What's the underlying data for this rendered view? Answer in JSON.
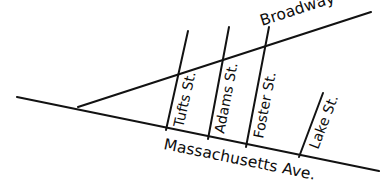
{
  "figure": {
    "name": "street-map-diagram",
    "background_color": "#ffffff",
    "line_color": "#121212",
    "text_color": "#0d0d0d",
    "width": 385,
    "height": 184
  },
  "roads": {
    "major": [
      {
        "id": "broadway",
        "label": "Broadway",
        "type": "avenue",
        "x1": 78,
        "y1": 107,
        "x2": 371,
        "y2": 12,
        "label_x": 262,
        "label_y": 26,
        "label_rotation": -18
      },
      {
        "id": "massachusetts-ave",
        "label": "Massachusetts Ave.",
        "type": "avenue",
        "x1": 17,
        "y1": 97,
        "x2": 379,
        "y2": 171,
        "label_x": 163,
        "label_y": 149,
        "label_rotation": 11.5
      }
    ],
    "cross": [
      {
        "id": "tufts-st",
        "label": "Tufts St.",
        "x1": 188,
        "y1": 31,
        "x2": 166,
        "y2": 130,
        "label_x": 183,
        "label_y": 128,
        "label_rotation": -77
      },
      {
        "id": "adams-st",
        "label": "Adams St.",
        "x1": 229,
        "y1": 27,
        "x2": 208,
        "y2": 139,
        "label_x": 224,
        "label_y": 134,
        "label_rotation": -79
      },
      {
        "id": "foster-st",
        "label": "Foster St.",
        "x1": 269,
        "y1": 27,
        "x2": 246,
        "y2": 147,
        "label_x": 263,
        "label_y": 139,
        "label_rotation": -79
      },
      {
        "id": "lake-st",
        "label": "Lake St.",
        "x1": 323,
        "y1": 93,
        "x2": 299,
        "y2": 157,
        "label_x": 318,
        "label_y": 150,
        "label_rotation": -69
      }
    ]
  }
}
